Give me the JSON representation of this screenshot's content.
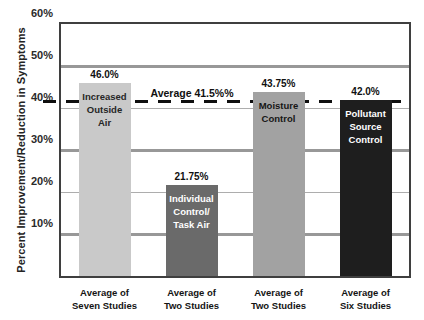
{
  "chart_data": {
    "type": "bar",
    "title": "",
    "xlabel": "",
    "ylabel": "Percent Improvement/Reduction in Symptoms",
    "ylim": [
      0,
      60
    ],
    "grid": "on",
    "yticks": [
      {
        "label": "60%",
        "value": 60
      },
      {
        "label": "50%",
        "value": 50
      },
      {
        "label": "40%",
        "value": 40
      },
      {
        "label": "30%",
        "value": 30
      },
      {
        "label": "20%",
        "value": 20
      },
      {
        "label": "10%",
        "value": 10
      }
    ],
    "gridline_thick_values": [
      50,
      30,
      10
    ],
    "gridline_thin_values": [
      40,
      20
    ],
    "average_line": {
      "value": 41.5,
      "label": "Average 41.5%%",
      "style": "dashed",
      "color": "#0f0f0f"
    },
    "categories": [
      "Increased Outside Air",
      "Individual Control/Task Air",
      "Moisture Control",
      "Pollutant Source Control"
    ],
    "values": [
      46.0,
      21.75,
      43.75,
      42.0
    ],
    "bars": [
      {
        "value": 46.0,
        "value_label": "46.0%",
        "bar_text": [
          "Increased",
          "Outside",
          "Air"
        ],
        "x_label": [
          "Average of",
          "Seven Studies"
        ],
        "color": "#c9c9c9",
        "text_color": "#262626"
      },
      {
        "value": 21.75,
        "value_label": "21.75%",
        "bar_text": [
          "Individual",
          "Control/",
          "Task Air"
        ],
        "x_label": [
          "Average of",
          "Two Studies"
        ],
        "color": "#6a6a6a",
        "text_color": "#ffffff"
      },
      {
        "value": 43.75,
        "value_label": "43.75%",
        "bar_text": [
          "Moisture",
          "Control"
        ],
        "x_label": [
          "Average of",
          "Two Studies"
        ],
        "color": "#a2a2a2",
        "text_color": "#161616"
      },
      {
        "value": 42.0,
        "value_label": "42.0%",
        "bar_text": [
          "Pollutant",
          "Source",
          "Control"
        ],
        "x_label": [
          "Average of",
          "Six Studies"
        ],
        "color": "#1e1e1e",
        "text_color": "#ffffff"
      }
    ],
    "colors": {
      "frame": "#3f3f3f",
      "grid_thick": "#989898",
      "grid_thin": "#adadad",
      "background": "#ffffff",
      "text": "#1b1b1b"
    }
  }
}
